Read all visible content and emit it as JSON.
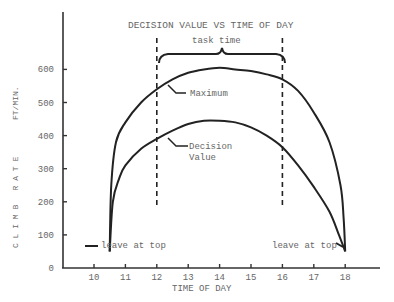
{
  "chart_data": {
    "type": "line",
    "title": "DECISION VALUE VS TIME OF DAY",
    "xlabel": "TIME OF DAY",
    "ylabel": "CLIMB RATE FT/MIN.",
    "x_ticks": [
      10,
      11,
      12,
      13,
      14,
      15,
      16,
      17,
      18
    ],
    "y_ticks": [
      0,
      100,
      200,
      300,
      400,
      500,
      600
    ],
    "xlim": [
      9.0,
      19.0
    ],
    "ylim": [
      0,
      780
    ],
    "grid": false,
    "series": [
      {
        "name": "Maximum",
        "x": [
          10.5,
          10.55,
          10.7,
          11,
          11.5,
          12,
          12.5,
          13,
          13.5,
          14,
          14.5,
          15,
          15.5,
          16,
          16.5,
          17,
          17.5,
          17.85,
          17.95,
          18
        ],
        "y": [
          50,
          250,
          380,
          440,
          500,
          540,
          570,
          590,
          600,
          605,
          600,
          595,
          585,
          570,
          535,
          470,
          380,
          250,
          150,
          50
        ]
      },
      {
        "name": "Decision Value",
        "x": [
          10.5,
          10.6,
          10.8,
          11,
          11.5,
          12,
          12.5,
          13,
          13.5,
          14,
          14.5,
          15,
          15.5,
          16,
          16.5,
          17,
          17.5,
          17.8,
          18
        ],
        "y": [
          50,
          200,
          270,
          310,
          360,
          390,
          415,
          435,
          445,
          445,
          440,
          425,
          400,
          365,
          310,
          245,
          170,
          100,
          50
        ]
      }
    ],
    "annotations": [
      {
        "text": "task time",
        "type": "brace",
        "x_range": [
          12,
          16
        ]
      },
      {
        "text": "Maximum",
        "points_to": "Maximum",
        "at_x": 12.3
      },
      {
        "text": "Decision Value",
        "points_to": "Decision Value",
        "at_x": 12.3
      },
      {
        "text": "leave at top",
        "at_x": 10.5,
        "at_y": 50
      },
      {
        "text": "leave at top",
        "at_x": 18,
        "at_y": 50
      }
    ],
    "vertical_dashed_lines": [
      12,
      16
    ],
    "legend": "none"
  },
  "labels": {
    "title": "DECISION VALUE VS TIME OF DAY",
    "xlabel": "TIME OF DAY",
    "ylabel_left": "C L I M B   R A T E",
    "ylabel_right": "FT/MIN.",
    "task_time": "task time",
    "maximum": "Maximum",
    "decision_1": "Decision",
    "decision_2": "Value",
    "leave_left": "leave at top",
    "leave_right": "leave at top"
  }
}
